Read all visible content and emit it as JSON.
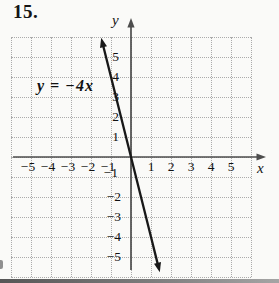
{
  "problem_number": "15.",
  "colors": {
    "background": "#fafaf8",
    "grid_dots": "#ababab",
    "axis": "#4d4d4d",
    "function_line": "#181818",
    "text": "#111111"
  },
  "chart_data": {
    "type": "line",
    "title": "",
    "equation": "y = −4x",
    "slope": -4,
    "intercept": 0,
    "xlabel": "x",
    "ylabel": "y",
    "xlim": [
      -6,
      6
    ],
    "ylim": [
      -6,
      6
    ],
    "grid": true,
    "grid_style": "dotted",
    "x_ticks": [
      {
        "value": -5,
        "label": "−5"
      },
      {
        "value": -4,
        "label": "−4"
      },
      {
        "value": -3,
        "label": "−3"
      },
      {
        "value": -2,
        "label": "−2"
      },
      {
        "value": -1,
        "label": "−1"
      },
      {
        "value": 1,
        "label": "1"
      },
      {
        "value": 2,
        "label": "2"
      },
      {
        "value": 3,
        "label": "3"
      },
      {
        "value": 4,
        "label": "4"
      },
      {
        "value": 5,
        "label": "5"
      }
    ],
    "y_ticks": [
      {
        "value": 5,
        "label": "5"
      },
      {
        "value": 4,
        "label": "4"
      },
      {
        "value": 3,
        "label": "3"
      },
      {
        "value": 2,
        "label": "2"
      },
      {
        "value": 1,
        "label": "1"
      },
      {
        "value": -1,
        "label": "−1"
      },
      {
        "value": -2,
        "label": "−2"
      },
      {
        "value": -3,
        "label": "−3"
      },
      {
        "value": -4,
        "label": "−4"
      },
      {
        "value": -5,
        "label": "−5"
      }
    ],
    "line_points": [
      {
        "x": -1.49,
        "y": 5.96
      },
      {
        "x": 1.44,
        "y": -5.76
      }
    ],
    "annotations": [
      {
        "text": "y = −4x",
        "anchor_data_xy": [
          -3.0,
          3.5
        ]
      }
    ]
  }
}
